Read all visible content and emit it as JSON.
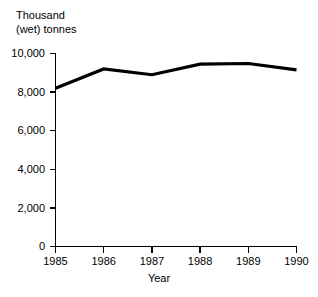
{
  "chart_data": {
    "type": "line",
    "title": "",
    "xlabel": "Year",
    "ylabel": "Thousand (wet) tonnes",
    "ylabel_lines": [
      "Thousand",
      "(wet) tonnes"
    ],
    "categories": [
      "1985",
      "1986",
      "1987",
      "1988",
      "1989",
      "1990"
    ],
    "x": [
      1985,
      1986,
      1987,
      1988,
      1989,
      1990
    ],
    "values": [
      8200,
      9200,
      8900,
      9450,
      9480,
      9150
    ],
    "series": [
      {
        "name": "Production",
        "values": [
          8200,
          9200,
          8900,
          9450,
          9480,
          9150
        ],
        "color": "#000000"
      }
    ],
    "ylim": [
      0,
      10000
    ],
    "xlim": [
      1985,
      1990
    ],
    "ytick_values": [
      0,
      2000,
      4000,
      6000,
      8000,
      10000
    ],
    "ytick_labels": [
      "0",
      "2,000",
      "4,000",
      "6,000",
      "8,000",
      "10,000"
    ],
    "xtick_labels": [
      "1985",
      "1986",
      "1987",
      "1988",
      "1989",
      "1990"
    ],
    "grid": false,
    "legend": false,
    "legend_position": "none",
    "annotations": []
  },
  "axes": {
    "y_title_line1": "Thousand",
    "y_title_line2": "(wet) tonnes",
    "x_title": "Year"
  },
  "ytick_labels": {
    "t0": "0",
    "t1": "2,000",
    "t2": "4,000",
    "t3": "6,000",
    "t4": "8,000",
    "t5": "10,000"
  },
  "xtick_labels": {
    "t0": "1985",
    "t1": "1986",
    "t2": "1987",
    "t3": "1988",
    "t4": "1989",
    "t5": "1990"
  },
  "colors": {
    "line": "#000000",
    "axis": "#000000",
    "background": "#ffffff"
  }
}
